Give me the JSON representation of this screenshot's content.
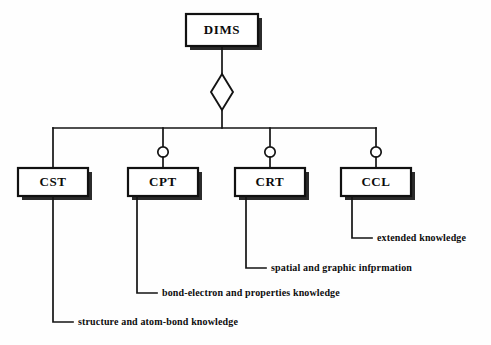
{
  "diagram": {
    "type": "uml-aggregation",
    "root": {
      "id": "dims",
      "label": "DIMS"
    },
    "aggregation_marker": "hollow-diamond",
    "classes": [
      {
        "id": "cst",
        "label": "CST",
        "connector": "plain-line",
        "annotation": "structure and atom-bond knowledge"
      },
      {
        "id": "cpt",
        "label": "CPT",
        "connector": "hollow-circle",
        "annotation": "bond-electron and properties knowledge"
      },
      {
        "id": "crt",
        "label": "CRT",
        "connector": "hollow-circle",
        "annotation": "spatial and graphic infprmation"
      },
      {
        "id": "ccl",
        "label": "CCL",
        "connector": "hollow-circle",
        "annotation": "extended knowledge"
      }
    ],
    "colors": {
      "background": "#fefefe",
      "stroke": "#141414",
      "box_fill": "#ffffff",
      "text": "#0b0b0b"
    }
  }
}
